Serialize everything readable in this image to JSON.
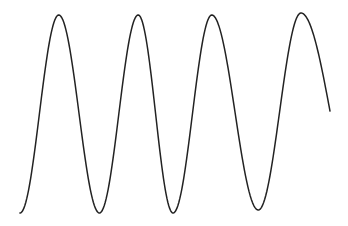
{
  "chart_data": {
    "type": "line",
    "title": "",
    "xlabel": "",
    "ylabel": "",
    "grid": false,
    "legend": "none",
    "axes_visible": false,
    "xlim": [
      0,
      8.2
    ],
    "ylim": [
      -1.05,
      1.05
    ],
    "series": [
      {
        "name": "wave",
        "color": "#222222",
        "description": "Sinusoid-like oscillation with 4 peaks and 3 troughs, ending mid-descent",
        "points": [
          {
            "x": 0.0,
            "y": -1.0
          },
          {
            "x": 1.0,
            "y": 1.0
          },
          {
            "x": 2.05,
            "y": -1.0
          },
          {
            "x": 3.05,
            "y": 1.0
          },
          {
            "x": 3.95,
            "y": -1.0
          },
          {
            "x": 4.95,
            "y": 1.0
          },
          {
            "x": 6.15,
            "y": -0.97
          },
          {
            "x": 7.25,
            "y": 1.02
          },
          {
            "x": 8.0,
            "y": 0.03
          }
        ]
      }
    ]
  }
}
